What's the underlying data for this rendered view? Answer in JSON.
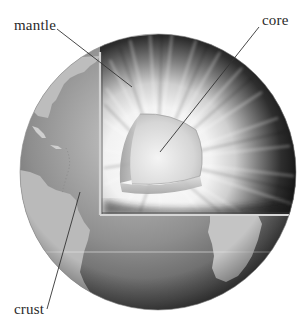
{
  "diagram": {
    "labels": {
      "mantle": "mantle",
      "core": "core",
      "crust": "crust"
    },
    "colors": {
      "background": "#ffffff",
      "ocean": "#7a7a7a",
      "land": "#b8b8b8",
      "mantle_dark": "#1e1e1e",
      "mantle_light": "#e8e8e8",
      "core": "#cfcfcf",
      "leader_line": "#333333",
      "label_text": "#2a2a2a"
    }
  }
}
